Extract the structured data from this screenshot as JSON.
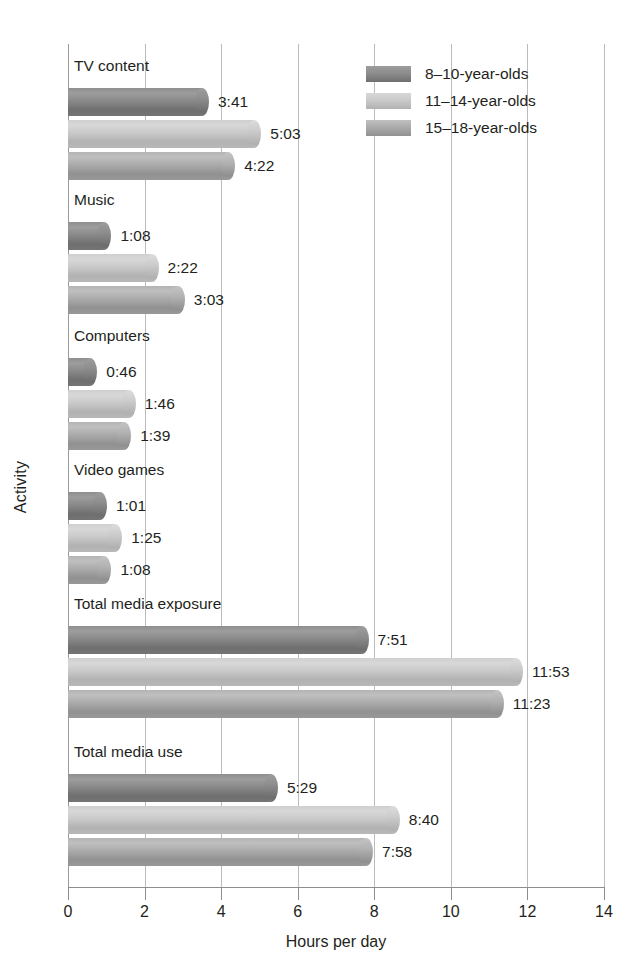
{
  "chart_data": {
    "type": "bar",
    "orientation": "horizontal",
    "title": "",
    "xlabel": "Hours per day",
    "ylabel": "Activity",
    "xlim": [
      0,
      14
    ],
    "xticks": [
      0,
      2,
      4,
      6,
      8,
      10,
      12,
      14
    ],
    "xtick_labels": [
      "0",
      "2",
      "4",
      "6",
      "8",
      "10",
      "12",
      "14"
    ],
    "grid": "vertical",
    "legend_position": "top-right",
    "categories": [
      "TV content",
      "Music",
      "Computers",
      "Video games",
      "Total media exposure",
      "Total media use"
    ],
    "series": [
      {
        "name": "8–10-year-olds",
        "color": "#7f7f7f",
        "labels": [
          "3:41",
          "1:08",
          "0:46",
          "1:01",
          "7:51",
          "5:29"
        ],
        "values": [
          3.683,
          1.133,
          0.767,
          1.017,
          7.85,
          5.483
        ]
      },
      {
        "name": "11–14-year-olds",
        "color": "#c6c6c6",
        "labels": [
          "5:03",
          "2:22",
          "1:46",
          "1:25",
          "11:53",
          "8:40"
        ],
        "values": [
          5.05,
          2.367,
          1.767,
          1.417,
          11.883,
          8.667
        ]
      },
      {
        "name": "15–18-year-olds",
        "color": "#a6a6a6",
        "labels": [
          "4:22",
          "3:03",
          "1:39",
          "1:08",
          "11:23",
          "7:58"
        ],
        "values": [
          4.367,
          3.05,
          1.65,
          1.133,
          11.383,
          7.967
        ]
      }
    ]
  }
}
